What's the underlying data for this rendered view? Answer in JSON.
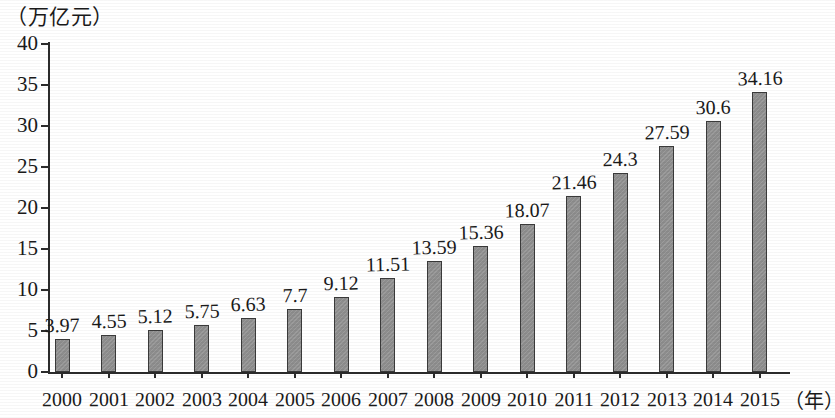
{
  "chart_data": {
    "type": "bar",
    "title": "",
    "subtitle": "",
    "xlabel": "（年）",
    "ylabel": "（万亿元）",
    "ylim": [
      0,
      40
    ],
    "ytick_step": 5,
    "yticks": [
      "40",
      "35",
      "30",
      "25",
      "20",
      "15",
      "10",
      "5",
      "0"
    ],
    "grid": false,
    "legend": null,
    "bar_color": "#8d8d8d",
    "bar_edge_color": "#3a3a3a",
    "axis_color": "#2b2b2b",
    "categories": [
      "2000",
      "2001",
      "2002",
      "2003",
      "2004",
      "2005",
      "2006",
      "2007",
      "2008",
      "2009",
      "2010",
      "2011",
      "2012",
      "2013",
      "2014",
      "2015"
    ],
    "values": [
      3.97,
      4.55,
      5.12,
      5.75,
      6.63,
      7.7,
      9.12,
      11.51,
      13.59,
      15.36,
      18.07,
      21.46,
      24.3,
      27.59,
      30.6,
      34.16
    ],
    "value_labels": [
      "3.97",
      "4.55",
      "5.12",
      "5.75",
      "6.63",
      "7.7",
      "9.12",
      "11.51",
      "13.59",
      "15.36",
      "18.07",
      "21.46",
      "24.3",
      "27.59",
      "30.6",
      "34.16"
    ]
  }
}
